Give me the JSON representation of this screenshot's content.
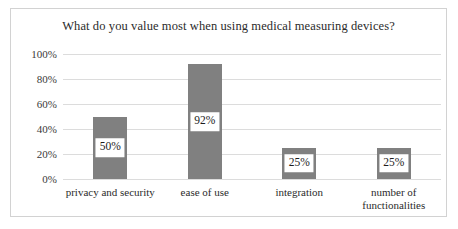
{
  "chart_data": {
    "type": "bar",
    "title": "What do you value most when using medical measuring devices?",
    "xlabel": "",
    "ylabel": "",
    "categories": [
      "privacy and security",
      "ease of use",
      "integration",
      "number of\nfunctionalities"
    ],
    "values": [
      50,
      92,
      25,
      25
    ],
    "data_labels": [
      "50%",
      "92%",
      "25%",
      "25%"
    ],
    "ylim": [
      0,
      100
    ],
    "yticks": [
      0,
      20,
      40,
      60,
      80,
      100
    ],
    "ytick_labels": [
      "0%",
      "20%",
      "40%",
      "60%",
      "80%",
      "100%"
    ],
    "grid": true,
    "legend": false,
    "bar_color": "#808080",
    "gridline_color": "#dcdcdc",
    "border_color": "#d2d2d2",
    "background_color": "#ffffff"
  }
}
